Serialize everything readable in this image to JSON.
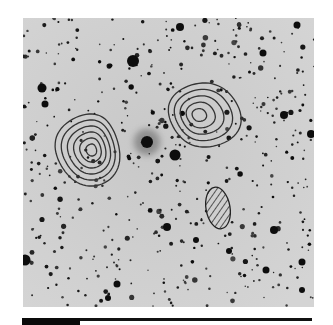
{
  "figure": {
    "type": "astronomical negative image with contour overlay",
    "background_color": "#cfcfcf",
    "star_color": "#111111",
    "contour_color": "#333333",
    "frame": {
      "x": 23,
      "y": 18,
      "width": 291,
      "height": 289
    },
    "bright_objects": [
      {
        "x": 133,
        "y": 61,
        "r": 6
      },
      {
        "x": 42,
        "y": 88,
        "r": 4.5
      },
      {
        "x": 45,
        "y": 104,
        "r": 3.5
      },
      {
        "x": 147,
        "y": 142,
        "r": 6,
        "diffuse": true
      },
      {
        "x": 175,
        "y": 155,
        "r": 5.5
      },
      {
        "x": 284,
        "y": 115,
        "r": 4
      },
      {
        "x": 311,
        "y": 134,
        "r": 4
      },
      {
        "x": 25,
        "y": 260,
        "r": 5.5
      },
      {
        "x": 167,
        "y": 227,
        "r": 4
      },
      {
        "x": 274,
        "y": 230,
        "r": 4
      },
      {
        "x": 180,
        "y": 27,
        "r": 4
      },
      {
        "x": 263,
        "y": 53,
        "r": 3.5
      },
      {
        "x": 297,
        "y": 25,
        "r": 3.5
      },
      {
        "x": 117,
        "y": 284,
        "r": 3.5
      },
      {
        "x": 302,
        "y": 262,
        "r": 3.5
      },
      {
        "x": 266,
        "y": 270,
        "r": 3.5
      },
      {
        "x": 229,
        "y": 251,
        "r": 3
      },
      {
        "x": 196,
        "y": 240,
        "r": 3
      },
      {
        "x": 108,
        "y": 298,
        "r": 3
      },
      {
        "x": 302,
        "y": 290,
        "r": 3
      }
    ],
    "contour_groups": [
      {
        "name": "left-source",
        "cx": 92,
        "cy": 150,
        "levels": 6,
        "outer_rx": 32,
        "outer_ry": 36,
        "skew": -0.15
      },
      {
        "name": "right-source",
        "cx": 198,
        "cy": 115,
        "levels": 5,
        "outer_rx": 36,
        "outer_ry": 32,
        "skew": 0.2
      }
    ],
    "hatched_ellipse": {
      "cx": 218,
      "cy": 208,
      "rx": 12,
      "ry": 21,
      "rotation": -10
    },
    "scale_bar": {
      "thick_width": 58,
      "total_width": 290
    }
  }
}
